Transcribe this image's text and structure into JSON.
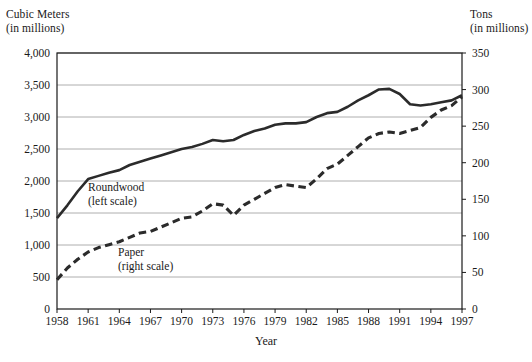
{
  "axes": {
    "left_title": "Cubic Meters\n(in millions)",
    "right_title": "Tons\n(in millions)",
    "x_label": "Year"
  },
  "legend": {
    "roundwood": "Roundwood\n(left scale)",
    "paper": "Paper\n(right scale)"
  },
  "colors": {
    "line": "#2b2b2b",
    "grid": "#9a9a9a",
    "axis": "#1a1a1a",
    "background": "#ffffff"
  },
  "chart_data": {
    "type": "line",
    "title": "",
    "xlabel": "Year",
    "grid": true,
    "legend_position": "inline",
    "x": [
      1958,
      1959,
      1960,
      1961,
      1962,
      1963,
      1964,
      1965,
      1966,
      1967,
      1968,
      1969,
      1970,
      1971,
      1972,
      1973,
      1974,
      1975,
      1976,
      1977,
      1978,
      1979,
      1980,
      1981,
      1982,
      1983,
      1984,
      1985,
      1986,
      1987,
      1988,
      1989,
      1990,
      1991,
      1992,
      1993,
      1994,
      1995,
      1996,
      1997
    ],
    "x_tick_labels": [
      "1958",
      "1961",
      "1964",
      "1967",
      "1970",
      "1973",
      "1976",
      "1979",
      "1982",
      "1985",
      "1988",
      "1991",
      "1994",
      "1997"
    ],
    "left_axis": {
      "label": "Cubic Meters (in millions)",
      "ylim": [
        0,
        4000
      ],
      "ticks": [
        0,
        500,
        1000,
        1500,
        2000,
        2500,
        3000,
        3500,
        4000
      ],
      "tick_labels": [
        "0",
        "500",
        "1,000",
        "1,500",
        "2,000",
        "2,500",
        "3,000",
        "3,500",
        "4,000"
      ]
    },
    "right_axis": {
      "label": "Tons (in millions)",
      "ylim": [
        0,
        350
      ],
      "ticks": [
        0,
        50,
        100,
        150,
        200,
        250,
        300,
        350
      ],
      "tick_labels": [
        "0",
        "50",
        "100",
        "150",
        "200",
        "250",
        "300",
        "350"
      ]
    },
    "series": [
      {
        "name": "Roundwood",
        "axis": "left",
        "style": "solid",
        "units": "cubic meters (millions)",
        "values": [
          1420,
          1620,
          1840,
          2030,
          2080,
          2130,
          2170,
          2250,
          2300,
          2350,
          2400,
          2450,
          2500,
          2530,
          2580,
          2640,
          2620,
          2640,
          2720,
          2780,
          2820,
          2880,
          2900,
          2900,
          2920,
          3000,
          3060,
          3080,
          3160,
          3260,
          3340,
          3430,
          3440,
          3360,
          3200,
          3180,
          3200,
          3230,
          3260,
          3340
        ]
      },
      {
        "name": "Paper",
        "axis": "right",
        "style": "dashed",
        "units": "tons (millions)",
        "values": [
          40,
          56,
          68,
          78,
          84,
          88,
          92,
          98,
          104,
          106,
          112,
          118,
          124,
          126,
          134,
          144,
          142,
          128,
          142,
          150,
          158,
          166,
          170,
          168,
          166,
          178,
          192,
          198,
          210,
          222,
          234,
          240,
          242,
          240,
          244,
          248,
          262,
          272,
          278,
          290
        ]
      }
    ]
  }
}
